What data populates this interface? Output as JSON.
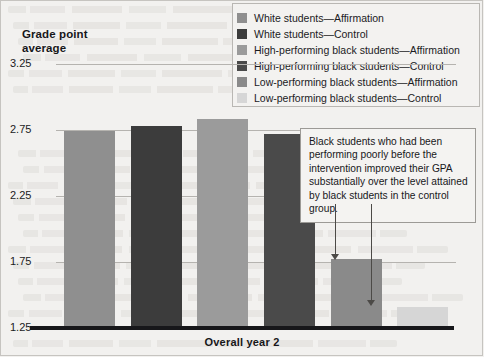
{
  "chart_data": {
    "type": "bar",
    "title": "Grade point average",
    "xlabel": "Overall year 2",
    "ylabel": "Grade point average",
    "ylim": [
      1.25,
      3.25
    ],
    "yticks": [
      3.25,
      2.75,
      2.25,
      1.75,
      1.25
    ],
    "grid": true,
    "legend_position": "top-right",
    "categories": [
      "White students—Affirmation",
      "White students—Control",
      "High-performing black students—Affirmation",
      "High-performing black students—Control",
      "Low-performing black students—Affirmation",
      "Low-performing black students—Control"
    ],
    "values": [
      2.74,
      2.78,
      2.83,
      2.72,
      1.77,
      1.41
    ],
    "colors": [
      "#8f8f8f",
      "#3c3c3c",
      "#9b9b9b",
      "#4a4a4a",
      "#8a8a8a",
      "#d6d6d6"
    ],
    "annotations": [
      "Black students who had been performing poorly before the intervention improved their GPA substantially over the level attained by black students in the control group."
    ]
  },
  "axis": {
    "title_line1": "Grade point",
    "title_line2": "average",
    "x_label": "Overall year 2",
    "ticks": [
      "3.25",
      "2.75",
      "2.25",
      "1.75",
      "1.25"
    ]
  },
  "legend": {
    "items": [
      {
        "label": "White students—Affirmation",
        "color": "#8f8f8f"
      },
      {
        "label": "White students—Control",
        "color": "#3c3c3c"
      },
      {
        "label": "High-performing black students—Affirmation",
        "color": "#9b9b9b"
      },
      {
        "label": "High-performing black students—Control",
        "color": "#4a4a4a"
      },
      {
        "label": "Low-performing black students—Affirmation",
        "color": "#8a8a8a"
      },
      {
        "label": "Low-performing black students—Control",
        "color": "#d6d6d6"
      }
    ]
  },
  "callout": {
    "text": "Black students who had been performing poorly before the intervention improved their GPA substantially over the level attained by black students in the control group."
  }
}
